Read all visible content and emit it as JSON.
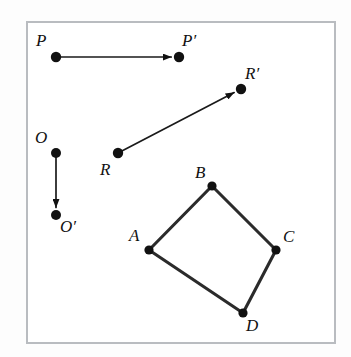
{
  "figure": {
    "grid": {
      "left": 27,
      "top": 22,
      "right": 335,
      "bottom": 343,
      "columns": 10,
      "rows": 10,
      "line_color": "#b9bcc0",
      "background_color": "#ffffff"
    },
    "colors": {
      "ink": "#111111",
      "polygon_stroke": "#2b2b2b",
      "page_background": "#fdfdfd"
    },
    "points": [
      {
        "id": "P",
        "label": "P",
        "x": 56,
        "y": 57,
        "label_x": 36,
        "label_y": 46,
        "radius": 5.2
      },
      {
        "id": "Pp",
        "label": "P′",
        "x": 179,
        "y": 57,
        "label_x": 182,
        "label_y": 46,
        "radius": 5.2
      },
      {
        "id": "O",
        "label": "O",
        "x": 56,
        "y": 153,
        "label_x": 35,
        "label_y": 143,
        "radius": 5.0
      },
      {
        "id": "Op",
        "label": "O′",
        "x": 56,
        "y": 215,
        "label_x": 60,
        "label_y": 232,
        "radius": 5.0
      },
      {
        "id": "R",
        "label": "R",
        "x": 118,
        "y": 153,
        "label_x": 100,
        "label_y": 175,
        "radius": 5.2
      },
      {
        "id": "Rp",
        "label": "R′",
        "x": 241,
        "y": 89,
        "label_x": 245,
        "label_y": 79,
        "radius": 5.2
      },
      {
        "id": "A",
        "label": "A",
        "x": 149,
        "y": 250,
        "label_x": 129,
        "label_y": 241,
        "radius": 4.6
      },
      {
        "id": "B",
        "label": "B",
        "x": 212,
        "y": 186,
        "label_x": 195,
        "label_y": 178,
        "radius": 4.6
      },
      {
        "id": "C",
        "label": "C",
        "x": 276,
        "y": 250,
        "label_x": 283,
        "label_y": 242,
        "radius": 4.6
      },
      {
        "id": "D",
        "label": "D",
        "x": 243,
        "y": 313,
        "label_x": 246,
        "label_y": 331,
        "radius": 4.6
      }
    ],
    "vectors": [
      {
        "id": "PP",
        "name": "vector-p-to-p-prime",
        "from": "P",
        "to": "Pp",
        "x1": 56,
        "y1": 57,
        "x2": 179,
        "y2": 57
      },
      {
        "id": "OO",
        "name": "vector-o-to-o-prime",
        "from": "O",
        "to": "Op",
        "x1": 56,
        "y1": 153,
        "x2": 56,
        "y2": 215
      },
      {
        "id": "RR",
        "name": "vector-r-to-r-prime",
        "from": "R",
        "to": "Rp",
        "x1": 118,
        "y1": 153,
        "x2": 241,
        "y2": 89
      }
    ],
    "polygon": {
      "name": "quadrilateral-abcd",
      "vertices": [
        "A",
        "B",
        "C",
        "D"
      ],
      "closed": true
    },
    "captions": {
      "figure_note": ""
    }
  }
}
